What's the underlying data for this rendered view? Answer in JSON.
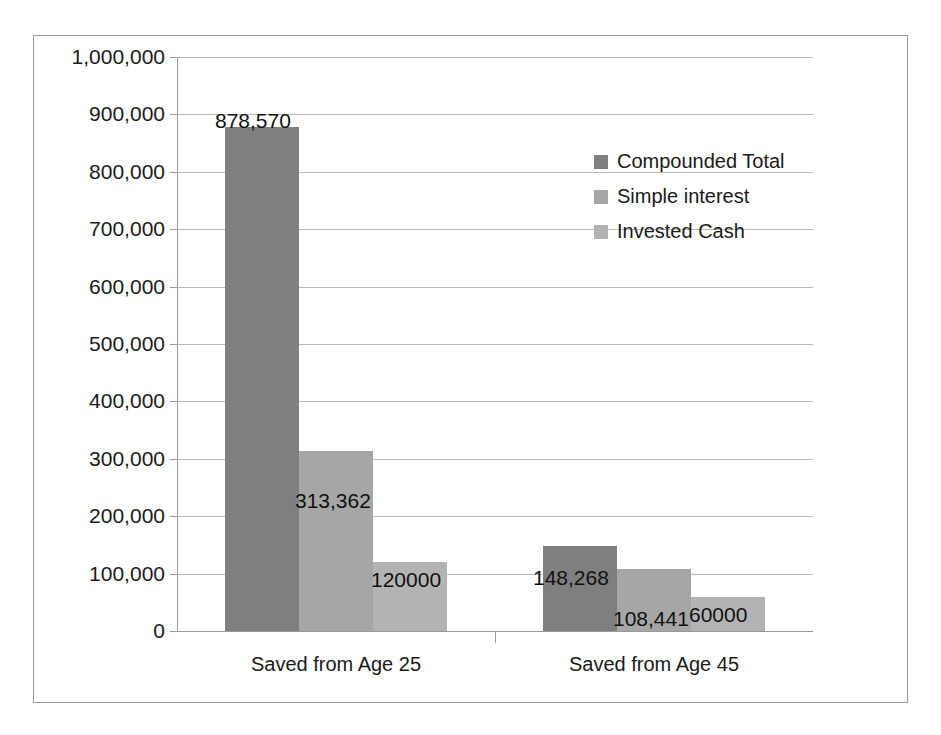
{
  "chart_data": {
    "type": "bar",
    "title": "",
    "xlabel": "",
    "ylabel": "",
    "grid": true,
    "legend_position": "inside-top-right",
    "categories": [
      "Saved from Age 25",
      "Saved from Age 45"
    ],
    "ylim": [
      0,
      1000000
    ],
    "ytick_labels": [
      "1,000,000",
      "900,000",
      "800,000",
      "700,000",
      "600,000",
      "500,000",
      "400,000",
      "300,000",
      "200,000",
      "100,000",
      "0"
    ],
    "ytick_values": [
      1000000,
      900000,
      800000,
      700000,
      600000,
      500000,
      400000,
      300000,
      200000,
      100000,
      0
    ],
    "series": [
      {
        "name": "Compounded Total",
        "color": "#7f7f7f",
        "values": [
          878570,
          148268
        ],
        "labels": [
          "878,570",
          "148,268"
        ]
      },
      {
        "name": "Simple interest",
        "color": "#a6a6a6",
        "values": [
          313362,
          108441
        ],
        "labels": [
          "313,362",
          "108,441"
        ]
      },
      {
        "name": "Invested Cash",
        "color": "#b3b3b3",
        "values": [
          120000,
          60000
        ],
        "labels": [
          "120000",
          "60000"
        ]
      }
    ]
  },
  "legend": {
    "items": [
      {
        "label": "Compounded Total"
      },
      {
        "label": "Simple interest"
      },
      {
        "label": "Invested Cash"
      }
    ]
  }
}
